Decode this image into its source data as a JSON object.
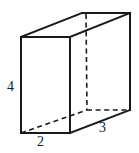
{
  "figure": {
    "name": "rectangular-prism-diagram",
    "shape": "rectangular prism",
    "stroke_color": "#1a1a1a",
    "face_color": "#ffffff",
    "background_color": "#ffffff",
    "labels": {
      "height": "4",
      "width": "2",
      "depth": "3"
    },
    "geometry": {
      "front_face": {
        "top_left": [
          21,
          37
        ],
        "top_right": [
          70,
          37
        ],
        "bottom_right": [
          70,
          133
        ],
        "bottom_left": [
          21,
          133
        ]
      },
      "back_face": {
        "top_left": [
          82,
          13
        ],
        "top_right": [
          130,
          13
        ],
        "bottom_right": [
          130,
          110
        ],
        "bottom_left": [
          87,
          110
        ]
      },
      "hidden_edges": [
        "back-left-vertical",
        "back-bottom-left-horizontal",
        "front-bottom-left-to-back-bottom-left"
      ]
    }
  }
}
